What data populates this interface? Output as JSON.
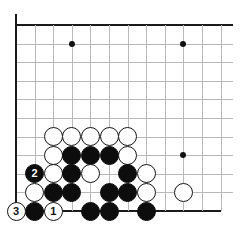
{
  "diagram": {
    "type": "go-board-problem",
    "board": {
      "origin_x": 16,
      "origin_y": 25,
      "spacing": 18.6,
      "cols_visible": 12,
      "rows_visible": 11,
      "edges": [
        "left",
        "top",
        "bottom"
      ],
      "line_color": "#b9b9b9",
      "edge_color": "#1a1a1a",
      "background": "#ffffff"
    },
    "star_points": [
      {
        "col": 3,
        "row": 1
      },
      {
        "col": 9,
        "row": 1
      },
      {
        "col": 9,
        "row": 7
      }
    ],
    "stones": [
      {
        "color": "white",
        "col": 2,
        "row": 6,
        "label": ""
      },
      {
        "color": "white",
        "col": 3,
        "row": 6,
        "label": ""
      },
      {
        "color": "white",
        "col": 4,
        "row": 6,
        "label": ""
      },
      {
        "color": "white",
        "col": 5,
        "row": 6,
        "label": ""
      },
      {
        "color": "white",
        "col": 6,
        "row": 6,
        "label": ""
      },
      {
        "color": "white",
        "col": 2,
        "row": 7,
        "label": ""
      },
      {
        "color": "black",
        "col": 3,
        "row": 7,
        "label": ""
      },
      {
        "color": "black",
        "col": 4,
        "row": 7,
        "label": ""
      },
      {
        "color": "black",
        "col": 5,
        "row": 7,
        "label": ""
      },
      {
        "color": "white",
        "col": 6,
        "row": 7,
        "label": ""
      },
      {
        "color": "black",
        "col": 1,
        "row": 8,
        "label": "2"
      },
      {
        "color": "white",
        "col": 2,
        "row": 8,
        "label": ""
      },
      {
        "color": "black",
        "col": 3,
        "row": 8,
        "label": ""
      },
      {
        "color": "white",
        "col": 4,
        "row": 8,
        "label": ""
      },
      {
        "color": "black",
        "col": 6,
        "row": 8,
        "label": ""
      },
      {
        "color": "white",
        "col": 7,
        "row": 8,
        "label": ""
      },
      {
        "color": "white",
        "col": 1,
        "row": 9,
        "label": ""
      },
      {
        "color": "black",
        "col": 2,
        "row": 9,
        "label": ""
      },
      {
        "color": "black",
        "col": 3,
        "row": 9,
        "label": ""
      },
      {
        "color": "black",
        "col": 5,
        "row": 9,
        "label": ""
      },
      {
        "color": "black",
        "col": 6,
        "row": 9,
        "label": ""
      },
      {
        "color": "white",
        "col": 7,
        "row": 9,
        "label": ""
      },
      {
        "color": "white",
        "col": 9,
        "row": 9,
        "label": ""
      },
      {
        "color": "white",
        "col": 0,
        "row": 10,
        "label": "3"
      },
      {
        "color": "black",
        "col": 1,
        "row": 10,
        "label": ""
      },
      {
        "color": "white",
        "col": 2,
        "row": 10,
        "label": "1"
      },
      {
        "color": "black",
        "col": 4,
        "row": 10,
        "label": ""
      },
      {
        "color": "black",
        "col": 5,
        "row": 10,
        "label": ""
      },
      {
        "color": "black",
        "col": 7,
        "row": 10,
        "label": ""
      }
    ],
    "move_numbers": [
      {
        "number": "1",
        "color": "white"
      },
      {
        "number": "2",
        "color": "black"
      },
      {
        "number": "3",
        "color": "white"
      }
    ]
  }
}
